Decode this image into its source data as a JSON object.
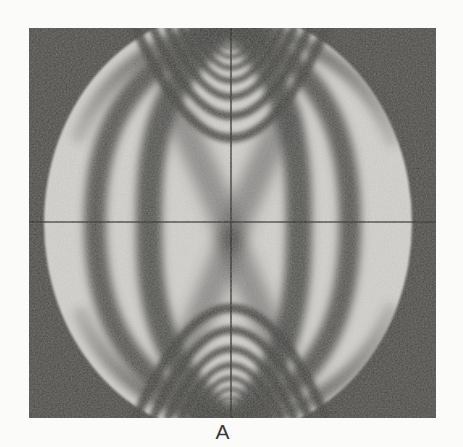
{
  "page": {
    "background": "#fbfbf9"
  },
  "figure": {
    "panel_label": "A",
    "kind": "photograph"
  },
  "colors": {
    "photo_background": "#4b4a47",
    "disk": "#d7d5d1",
    "fringe": "#434240",
    "arc_fringe": "#3e3d3b",
    "crosshair": "#262624",
    "label_text": "#3a3a3a"
  },
  "photo_geometry": {
    "x": 29,
    "y": 28,
    "width": 407,
    "height": 390,
    "disk": {
      "cx": 199,
      "cy": 195,
      "rx": 184,
      "ry": 212
    },
    "crosshair": {
      "horizontal_y": 194,
      "vertical_x": 202,
      "stroke_width": 1.6,
      "opacity": 0.85
    },
    "load_points": {
      "top": [
        202,
        -2
      ],
      "bottom": [
        202,
        392
      ]
    },
    "side_fringes": [
      {
        "path": "M 200,-4 C 86,42 66,118 66,195 C 66,272 86,352 200,396",
        "w": 22,
        "opacity": 0.88
      },
      {
        "path": "M 201,-4 C 124,58 120,128 120,195 C 120,262 124,332 201,396",
        "w": 26,
        "opacity": 0.9
      },
      {
        "path": "M 203,-4 C 266,58 270,128 270,195 C 270,262 266,332 203,396",
        "w": 26,
        "opacity": 0.9
      },
      {
        "path": "M 204,-4 C 304,42 321,118 321,195 C 321,272 304,352 204,396",
        "w": 22,
        "opacity": 0.88
      }
    ],
    "edge_fringes": [
      {
        "path": "M 197,-4 C 130,8 76,44 50,108",
        "w": 15,
        "fade": "top"
      },
      {
        "path": "M 207,-4 C 282,8 338,46 363,112",
        "w": 15,
        "fade": "top"
      },
      {
        "path": "M 197,396 C 130,384 78,348 52,286",
        "w": 15,
        "fade": "bottom"
      },
      {
        "path": "M 207,396 C 282,384 336,346 361,282",
        "w": 15,
        "fade": "bottom"
      }
    ],
    "center_cross_arms": {
      "paths": [
        "M 152,92 Q 188,168 201,208",
        "M 254,92 Q 218,168 203,208",
        "M 201,214 Q 184,262 158,318",
        "M 203,214 Q 222,262 248,318"
      ],
      "w": 28,
      "opacity": 0.5
    },
    "load_point_arcs": {
      "half_widths": [
        10,
        16,
        23,
        31,
        40,
        51,
        64,
        79,
        96
      ],
      "depths": [
        9,
        15,
        22,
        31,
        42,
        55,
        71,
        90,
        112
      ],
      "stroke_widths": [
        2.5,
        3,
        3.5,
        4.5,
        5.5,
        6.5,
        7.5,
        8.5,
        9.5
      ],
      "opacity": 0.88
    },
    "grain_opacity": 0.45
  }
}
